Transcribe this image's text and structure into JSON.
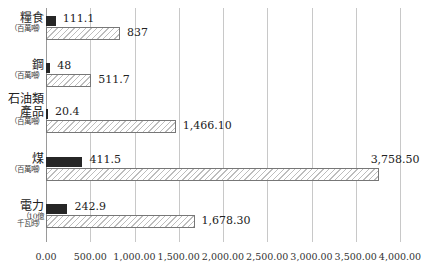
{
  "chart_data": {
    "type": "bar",
    "orientation": "horizontal",
    "title": "",
    "xlabel": "",
    "ylabel": "",
    "xlim": [
      0,
      4000
    ],
    "grid": true,
    "legend": null,
    "x_ticks": [
      "0.00",
      "500.00",
      "1,000.00",
      "1,500.00",
      "2,000.00",
      "2,500.00",
      "3,000.00",
      "3,500.00",
      "4,000.00"
    ],
    "categories": [
      {
        "label": "糧食",
        "unit": "（百萬噸）"
      },
      {
        "label": "鋼",
        "unit": "（百萬噸）"
      },
      {
        "label": "石油類產品",
        "label_lines": [
          "石油類",
          "產品"
        ],
        "unit": "（百萬噸）"
      },
      {
        "label": "煤",
        "unit": "（百萬噸）"
      },
      {
        "label": "電力",
        "unit_lines": [
          "（10億",
          "千瓦時）"
        ]
      }
    ],
    "series": [
      {
        "name": "series-dark",
        "style": "solid-black",
        "values": [
          111.1,
          48,
          20.4,
          411.5,
          242.9
        ],
        "labels": [
          "111.1",
          "48",
          "20.4",
          "411.5",
          "242.9"
        ]
      },
      {
        "name": "series-hatched",
        "style": "hatched",
        "values": [
          837,
          511.7,
          1466.1,
          3758.5,
          1678.3
        ],
        "labels": [
          "837",
          "511.7",
          "1,466.10",
          "3,758.50",
          "1,678.30"
        ]
      }
    ]
  }
}
